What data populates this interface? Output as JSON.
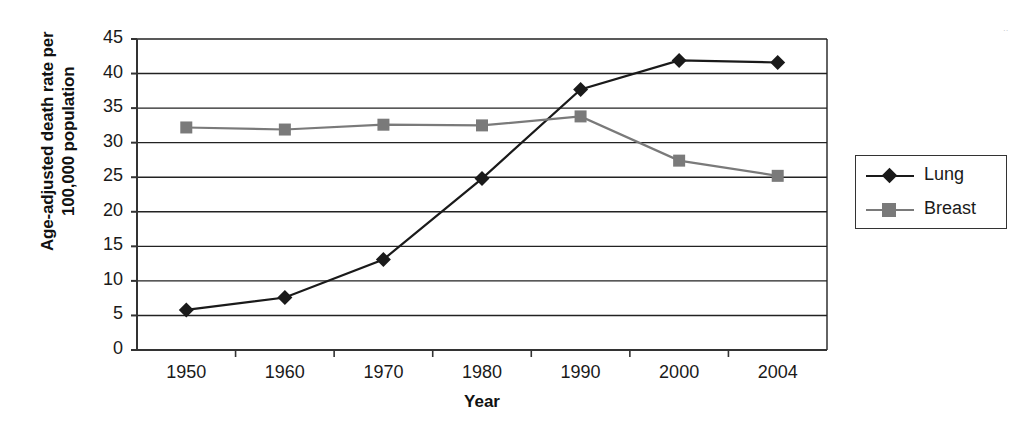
{
  "chart_data": {
    "type": "line",
    "title": "",
    "xlabel": "Year",
    "ylabel": "Age-adjusted death rate per 100,000 population",
    "ylabel_line1": "Age-adjusted death rate per",
    "ylabel_line2": "100,000 population",
    "categories": [
      "1950",
      "1960",
      "1970",
      "1980",
      "1990",
      "2000",
      "2004"
    ],
    "x_tick_labels": [
      "1950",
      "1960",
      "1970",
      "1980",
      "1990",
      "2000",
      "2004"
    ],
    "y_tick_labels": [
      "0",
      "5",
      "10",
      "15",
      "20",
      "25",
      "30",
      "35",
      "40",
      "45"
    ],
    "y_ticks": [
      0,
      5,
      10,
      15,
      20,
      25,
      30,
      35,
      40,
      45
    ],
    "ylim": [
      0,
      45
    ],
    "grid": "horizontal",
    "legend_position": "right",
    "series": [
      {
        "name": "Lung",
        "color": "#1a1a1a",
        "marker": "diamond",
        "values": [
          5.8,
          7.6,
          13.1,
          24.8,
          37.7,
          41.9,
          41.6
        ]
      },
      {
        "name": "Breast",
        "color": "#7a7a7a",
        "marker": "square",
        "values": [
          32.2,
          31.9,
          32.6,
          32.5,
          33.8,
          27.4,
          25.2
        ]
      }
    ]
  },
  "legend": {
    "entries": [
      {
        "label": "Lung"
      },
      {
        "label": "Breast"
      }
    ]
  },
  "colors": {
    "lung": "#1a1a1a",
    "breast": "#7a7a7a",
    "axis": "#333333",
    "grid": "#222222"
  }
}
